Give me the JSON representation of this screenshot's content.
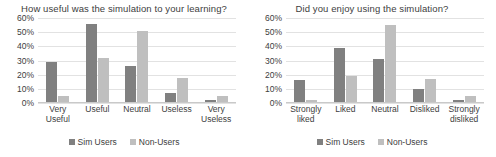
{
  "charts": [
    {
      "title": "How useful was the simulation to your learning?",
      "legend": [
        {
          "label": "Sim Users",
          "color": "#808080",
          "key": "sim"
        },
        {
          "label": "Non-Users",
          "color": "#bfbfbf",
          "key": "non"
        }
      ],
      "yticks": [
        "0%",
        "10%",
        "20%",
        "30%",
        "40%",
        "50%",
        "60%"
      ],
      "categories": [
        {
          "line1": "Very",
          "line2": "Useful"
        },
        {
          "line1": "Useful",
          "line2": ""
        },
        {
          "line1": "Neutral",
          "line2": ""
        },
        {
          "line1": "Useless",
          "line2": ""
        },
        {
          "line1": "Very",
          "line2": "Useless"
        }
      ]
    },
    {
      "title": "Did you enjoy using the simulation?",
      "legend": [
        {
          "label": "Sim Users",
          "color": "#808080",
          "key": "sim"
        },
        {
          "label": "Non-Users",
          "color": "#bfbfbf",
          "key": "non"
        }
      ],
      "yticks": [
        "0%",
        "10%",
        "20%",
        "30%",
        "40%",
        "50%",
        "60%"
      ],
      "categories": [
        {
          "line1": "Strongly",
          "line2": "liked"
        },
        {
          "line1": "Liked",
          "line2": ""
        },
        {
          "line1": "Neutral",
          "line2": ""
        },
        {
          "line1": "Disliked",
          "line2": ""
        },
        {
          "line1": "Strongly",
          "line2": "disliked"
        }
      ]
    }
  ],
  "chart_data": [
    {
      "type": "bar",
      "title": "How useful was the simulation to your learning?",
      "xlabel": "",
      "ylabel": "",
      "ylim": [
        0,
        60
      ],
      "ytick_values": [
        0,
        10,
        20,
        30,
        40,
        50,
        60
      ],
      "ytick_labels": [
        "0%",
        "10%",
        "20%",
        "30%",
        "40%",
        "50%",
        "60%"
      ],
      "grid": true,
      "legend_position": "bottom",
      "categories": [
        "Very Useful",
        "Useful",
        "Neutral",
        "Useless",
        "Very Useless"
      ],
      "series": [
        {
          "name": "Sim Users",
          "color": "#808080",
          "values": [
            29,
            56,
            26,
            7,
            2
          ]
        },
        {
          "name": "Non-Users",
          "color": "#bfbfbf",
          "values": [
            5,
            32,
            51,
            18,
            5
          ]
        }
      ]
    },
    {
      "type": "bar",
      "title": "Did you enjoy using the simulation?",
      "xlabel": "",
      "ylabel": "",
      "ylim": [
        0,
        60
      ],
      "ytick_values": [
        0,
        10,
        20,
        30,
        40,
        50,
        60
      ],
      "ytick_labels": [
        "0%",
        "10%",
        "20%",
        "30%",
        "40%",
        "50%",
        "60%"
      ],
      "grid": true,
      "legend_position": "bottom",
      "categories": [
        "Strongly liked",
        "Liked",
        "Neutral",
        "Disliked",
        "Strongly disliked"
      ],
      "series": [
        {
          "name": "Sim Users",
          "color": "#808080",
          "values": [
            16,
            39,
            31,
            10,
            2
          ]
        },
        {
          "name": "Non-Users",
          "color": "#bfbfbf",
          "values": [
            2,
            19,
            55,
            17,
            5
          ]
        }
      ]
    }
  ]
}
